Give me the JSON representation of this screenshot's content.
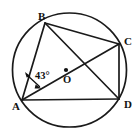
{
  "figure": {
    "type": "circle-geometry-diagram",
    "background_color": "#ffffff",
    "stroke_color": "#1a1a1a",
    "text_color": "#111111",
    "circle": {
      "center_label": "O",
      "cx": 69.5,
      "cy": 70,
      "r": 57
    },
    "points": [
      {
        "id": "A",
        "label": "A",
        "x": 22,
        "y": 100,
        "label_x": 12,
        "label_y": 110
      },
      {
        "id": "B",
        "label": "B",
        "x": 45,
        "y": 23,
        "label_x": 38,
        "label_y": 20
      },
      {
        "id": "C",
        "label": "C",
        "x": 119,
        "y": 44,
        "label_x": 124,
        "label_y": 45
      },
      {
        "id": "D",
        "label": "D",
        "x": 119,
        "y": 99,
        "label_x": 124,
        "label_y": 108
      }
    ],
    "center_point": {
      "label": "O",
      "x": 66,
      "y": 70,
      "label_x": 65,
      "label_y": 82
    },
    "segments": [
      {
        "name": "AB",
        "from": "A",
        "to": "B",
        "kind": "chord"
      },
      {
        "name": "BC",
        "from": "B",
        "to": "C",
        "kind": "chord"
      },
      {
        "name": "CD",
        "from": "C",
        "to": "D",
        "kind": "chord"
      },
      {
        "name": "AD",
        "from": "A",
        "to": "D",
        "kind": "chord"
      },
      {
        "name": "AC",
        "from": "A",
        "to": "C",
        "kind": "diagonal"
      },
      {
        "name": "BD",
        "from": "B",
        "to": "D",
        "kind": "diagonal"
      }
    ],
    "angle": {
      "label": "43°",
      "value": 43,
      "unit": "degrees",
      "vertex": "A",
      "between": [
        "AB",
        "AC"
      ],
      "label_x": 36,
      "label_y": 78
    }
  }
}
